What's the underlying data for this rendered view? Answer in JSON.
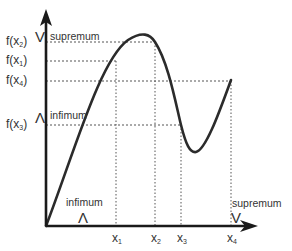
{
  "diagram": {
    "title": "",
    "y_axis": {
      "ticks": [
        {
          "id": "fx2",
          "label_main": "f(x",
          "sub": "2",
          "label_end": ")",
          "y": 42
        },
        {
          "id": "fx1",
          "label_main": "f(x",
          "sub": "1",
          "label_end": ")",
          "y": 61
        },
        {
          "id": "fx4",
          "label_main": "f(x",
          "sub": "4",
          "label_end": ")",
          "y": 81
        },
        {
          "id": "fx3",
          "label_main": "f(x",
          "sub": "3",
          "label_end": ")",
          "y": 125
        }
      ]
    },
    "x_axis": {
      "ticks": [
        {
          "id": "x1",
          "label_main": "x",
          "sub": "1",
          "x": 116
        },
        {
          "id": "x2",
          "label_main": "x",
          "sub": "2",
          "x": 155
        },
        {
          "id": "x3",
          "label_main": "x",
          "sub": "3",
          "x": 181
        },
        {
          "id": "x4",
          "label_main": "x",
          "sub": "4",
          "x": 231
        }
      ]
    },
    "annotations": {
      "range_supremum": {
        "symbol": "V",
        "word": "supremum"
      },
      "range_infimum": {
        "symbol": "Λ",
        "word": "infimum"
      },
      "domain_infimum": {
        "symbol": "Λ",
        "word": "infimum"
      },
      "domain_supremum": {
        "symbol": "V",
        "word": "supremum"
      }
    },
    "colors": {
      "axis": "#1a1a1a",
      "curve": "#2b2b2b",
      "guide": "#444444",
      "text": "#333333"
    }
  }
}
